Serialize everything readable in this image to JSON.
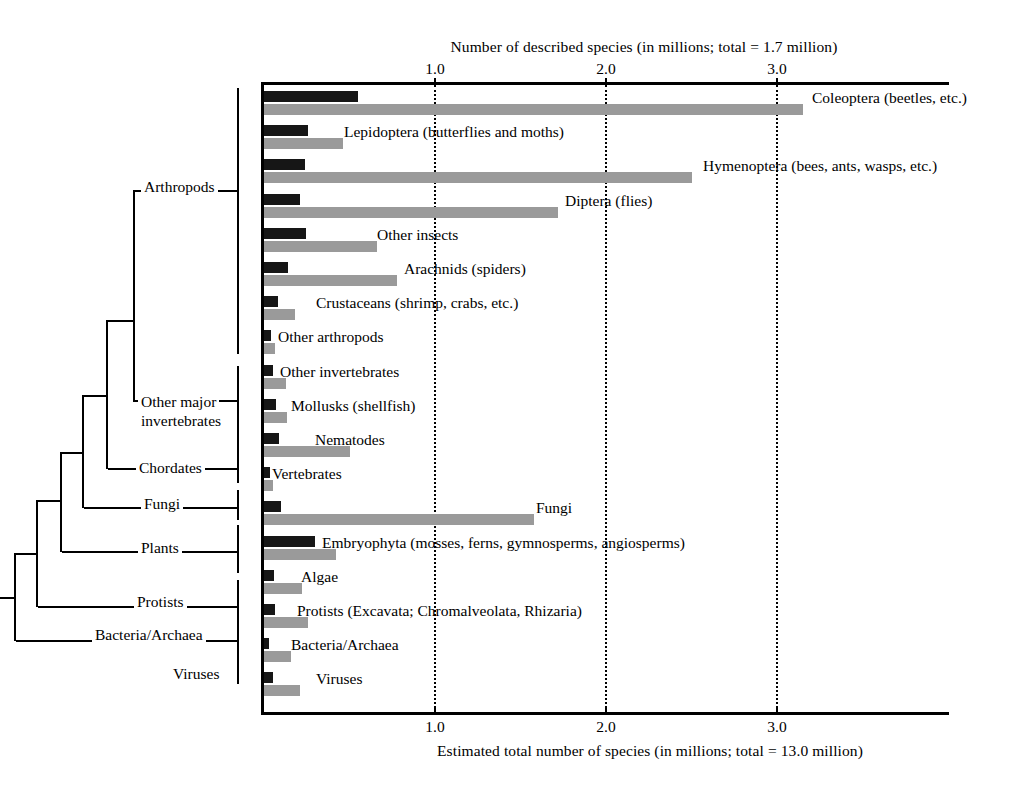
{
  "chart_data": {
    "type": "bar",
    "orientation": "horizontal",
    "title": "",
    "top_axis_label": "Number of described species (in millions; total = 1.7 million)",
    "bottom_axis_label": "Estimated total number of species (in millions; total = 13.0 million)",
    "xlabel": "Number of species (millions)",
    "ylabel": "",
    "xlim": [
      0,
      4.0
    ],
    "tick_values": [
      1.0,
      2.0,
      3.0
    ],
    "tick_labels": [
      "1.0",
      "2.0",
      "3.0"
    ],
    "grid": true,
    "grid_style": "dotted vertical",
    "legend_position": "none",
    "series": [
      {
        "name": "Number of described species",
        "color": "#161616",
        "values": [
          0.55,
          0.26,
          0.24,
          0.21,
          0.245,
          0.14,
          0.08,
          0.04,
          0.055,
          0.07,
          0.085,
          0.035,
          0.1,
          0.3,
          0.06,
          0.065,
          0.03,
          0.055
        ]
      },
      {
        "name": "Estimated total number of species",
        "color": "#9a9a9a",
        "values": [
          3.15,
          0.46,
          2.5,
          1.72,
          0.66,
          0.78,
          0.18,
          0.065,
          0.13,
          0.135,
          0.5,
          0.055,
          1.58,
          0.42,
          0.22,
          0.26,
          0.155,
          0.21
        ]
      }
    ],
    "categories": [
      "Coleoptera (beetles, etc.)",
      "Lepidoptera (butterflies and moths)",
      "Hymenoptera (bees, ants, wasps, etc.)",
      "Diptera (flies)",
      "Other insects",
      "Arachnids (spiders)",
      "Crustaceans (shrimp, crabs, etc.)",
      "Other arthropods",
      "Other invertebrates",
      "Mollusks (shellfish)",
      "Nematodes",
      "Vertebrates",
      "Fungi",
      "Embryophyta (mosses, ferns, gymnosperms, angiosperms)",
      "Algae",
      "Protists (Excavata; Chromalveolata, Rhizaria)",
      "Bacteria/Archaea",
      "Viruses"
    ]
  },
  "rows": [
    {
      "label": "Coleoptera (beetles, etc.)",
      "dark": 0.55,
      "light": 3.15,
      "label_x": 548
    },
    {
      "label": "Lepidoptera (butterflies and moths)",
      "dark": 0.26,
      "light": 0.46,
      "label_x": 80
    },
    {
      "label": "Hymenoptera (bees, ants, wasps, etc.)",
      "dark": 0.24,
      "light": 2.5,
      "label_x": 439
    },
    {
      "label": "Diptera (flies)",
      "dark": 0.21,
      "light": 1.72,
      "label_x": 301
    },
    {
      "label": "Other insects",
      "dark": 0.245,
      "light": 0.66,
      "label_x": 113
    },
    {
      "label": "Arachnids (spiders)",
      "dark": 0.14,
      "light": 0.78,
      "label_x": 140
    },
    {
      "label": "Crustaceans (shrimp, crabs, etc.)",
      "dark": 0.08,
      "light": 0.18,
      "label_x": 52
    },
    {
      "label": "Other arthropods",
      "dark": 0.04,
      "light": 0.065,
      "label_x": 14
    },
    {
      "label": "Other invertebrates",
      "dark": 0.055,
      "light": 0.13,
      "label_x": 16
    },
    {
      "label": "Mollusks (shellfish)",
      "dark": 0.07,
      "light": 0.135,
      "label_x": 27
    },
    {
      "label": "Nematodes",
      "dark": 0.085,
      "light": 0.5,
      "label_x": 51
    },
    {
      "label": "Vertebrates",
      "dark": 0.035,
      "light": 0.055,
      "label_x": 8
    },
    {
      "label": "Fungi",
      "dark": 0.1,
      "light": 1.58,
      "label_x": 272
    },
    {
      "label": "Embryophyta (mosses, ferns, gymnosperms, angiosperms)",
      "dark": 0.3,
      "light": 0.42,
      "label_x": 58
    },
    {
      "label": "Algae",
      "dark": 0.06,
      "light": 0.22,
      "label_x": 37
    },
    {
      "label": "Protists (Excavata; Chromalveolata, Rhizaria)",
      "dark": 0.065,
      "light": 0.26,
      "label_x": 33
    },
    {
      "label": "Bacteria/Archaea",
      "dark": 0.03,
      "light": 0.155,
      "label_x": 27
    },
    {
      "label": "Viruses",
      "dark": 0.055,
      "light": 0.21,
      "label_x": 52
    }
  ],
  "clado_labels": [
    {
      "name": "arthropods",
      "text": "Arthropods",
      "x": 141,
      "y": 108
    },
    {
      "name": "other-major-inv",
      "text": "Other major",
      "x": 138,
      "y": 323
    },
    {
      "name": "other-major-inv2",
      "text": "invertebrates",
      "x": 138,
      "y": 342
    },
    {
      "name": "chordates",
      "text": "Chordates",
      "x": 136,
      "y": 389
    },
    {
      "name": "fungi",
      "text": "Fungi",
      "x": 141,
      "y": 425
    },
    {
      "name": "plants",
      "text": "Plants",
      "x": 138,
      "y": 469
    },
    {
      "name": "protists",
      "text": "Protists",
      "x": 134,
      "y": 523
    },
    {
      "name": "bacteria-archaea",
      "text": "Bacteria/Archaea",
      "x": 92,
      "y": 556
    },
    {
      "name": "viruses",
      "text": "Viruses",
      "x": 170,
      "y": 595
    }
  ],
  "colors": {
    "described": "#161616",
    "estimated": "#9a9a9a",
    "axis": "#000000",
    "background": "#ffffff"
  }
}
